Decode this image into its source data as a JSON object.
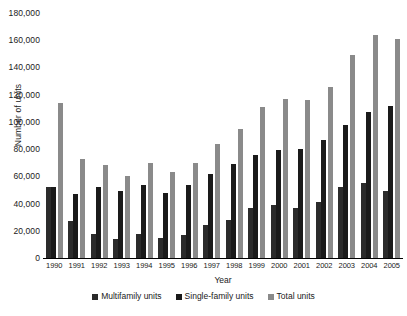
{
  "chart_data": {
    "type": "bar",
    "title": "",
    "xlabel": "Year",
    "ylabel": "Number of units",
    "ylim": [
      0,
      180000
    ],
    "ytick_step": 20000,
    "ytick_labels": [
      "180,000",
      "160,000",
      "140,000",
      "120,000",
      "100,000",
      "80,000",
      "60,000",
      "40,000",
      "20,000",
      "0"
    ],
    "ytick_values": [
      180000,
      160000,
      140000,
      120000,
      100000,
      80000,
      60000,
      40000,
      20000,
      0
    ],
    "grid": false,
    "legend_position": "bottom",
    "categories": [
      "1990",
      "1991",
      "1992",
      "1993",
      "1994",
      "1995",
      "1996",
      "1997",
      "1998",
      "1999",
      "2000",
      "2001",
      "2002",
      "2003",
      "2004",
      "2005"
    ],
    "series": [
      {
        "name": "Multifamily units",
        "color": "#2b2b2b",
        "values": [
          52000,
          27000,
          18000,
          14000,
          18000,
          15000,
          17000,
          24000,
          28000,
          37000,
          39000,
          37000,
          41000,
          52000,
          55000,
          49000
        ]
      },
      {
        "name": "Single-family units",
        "color": "#1a1a1a",
        "values": [
          52000,
          47000,
          52000,
          49000,
          54000,
          48000,
          54000,
          62000,
          69000,
          76000,
          79000,
          80000,
          87000,
          98000,
          107000,
          112000
        ]
      },
      {
        "name": "Total units",
        "color": "#8a8a8a",
        "values": [
          114000,
          73000,
          68000,
          60000,
          70000,
          63000,
          70000,
          84000,
          95000,
          111000,
          117000,
          116000,
          126000,
          149000,
          164000,
          161000
        ]
      }
    ]
  }
}
